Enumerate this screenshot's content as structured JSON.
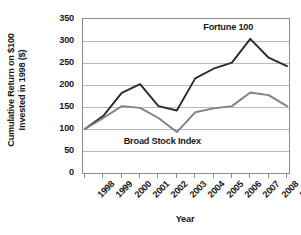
{
  "chart_data": {
    "type": "line",
    "title": "",
    "xlabel": "Year",
    "ylabel": "Cumulative Return on $100 Invested in 1998 ($)",
    "ylabel_lines": [
      "Cumulative Return on $100",
      "Invested in 1998 ($)"
    ],
    "categories": [
      "1998",
      "1999",
      "2000",
      "2001",
      "2002",
      "2003",
      "2004",
      "2005",
      "2006",
      "2007",
      "2008",
      "2009"
    ],
    "x": [
      1998,
      1999,
      2000,
      2001,
      2002,
      2003,
      2004,
      2005,
      2006,
      2007,
      2008,
      2009
    ],
    "ylim": [
      0,
      350
    ],
    "yticks": [
      0,
      50,
      100,
      150,
      200,
      250,
      300,
      350
    ],
    "ytick_labels": [
      "0",
      "50",
      "100",
      "150",
      "200",
      "250",
      "300",
      "350"
    ],
    "grid": "horizontal",
    "legend_position": "inline-annotation",
    "series": [
      {
        "name": "Fortune 100",
        "color": "#2b2b2b",
        "values": [
          100,
          130,
          182,
          202,
          152,
          142,
          215,
          237,
          251,
          305,
          262,
          243
        ]
      },
      {
        "name": "Broad Stock Index",
        "color": "#828282",
        "values": [
          100,
          125,
          152,
          148,
          125,
          93,
          138,
          147,
          152,
          183,
          177,
          152
        ]
      }
    ],
    "annotations": [
      {
        "text": "Fortune 100",
        "x_frac": 0.705,
        "y_value": 332
      },
      {
        "text": "Broad Stock Index",
        "x_frac": 0.385,
        "y_value": 73
      }
    ]
  },
  "colors": {
    "frame": "#8c8c8c",
    "grid": "#b9b9b9",
    "text": "#1a1a1a",
    "background": "#ffffff",
    "fortune_100": "#2b2b2b",
    "broad_stock_index": "#828282"
  }
}
